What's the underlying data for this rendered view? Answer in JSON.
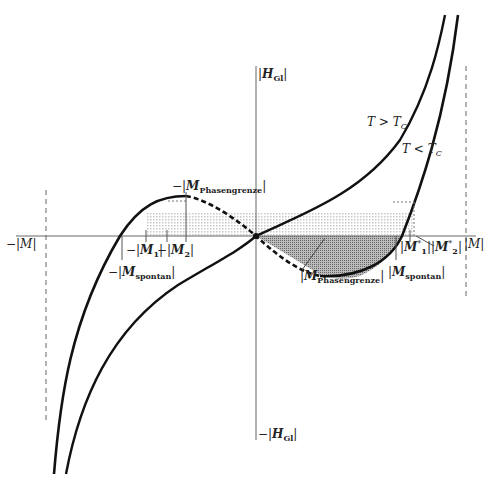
{
  "diagram": {
    "type": "magnetization-field isotherms (van der Waals-like loop)",
    "curves": [
      {
        "name": "T > Tc",
        "label": "T > T",
        "sub": "C",
        "style": "solid"
      },
      {
        "name": "T < Tc",
        "label": "T < T",
        "sub": "C",
        "style": "solid with dashed unstable segment"
      }
    ],
    "axes": {
      "y_pos": {
        "prefix": "|",
        "main": "H",
        "sub": "Gl",
        "suffix": "|"
      },
      "y_neg": {
        "prefix": "−|",
        "main": "H",
        "sub": "Gl",
        "suffix": "|"
      },
      "x_pos": {
        "text": "|M|"
      },
      "x_neg": {
        "text": "−|M|"
      }
    },
    "labels": {
      "neg_phasengrenze": {
        "prefix": "−|",
        "main": "M",
        "sub": "Phasengrenze",
        "suffix": "|"
      },
      "neg_m1": {
        "prefix": "−|",
        "main": "M",
        "sub": "1",
        "suffix": "|"
      },
      "neg_m2": {
        "prefix": "−|",
        "main": "M",
        "sub": "2",
        "suffix": "|"
      },
      "neg_spontan": {
        "prefix": "−|",
        "main": "M",
        "sub": "spontan",
        "suffix": "|"
      },
      "pos_phasengrenze": {
        "prefix": "|",
        "main": "M",
        "sub": "Phasengrenze",
        "suffix": "|"
      },
      "pos_m1": {
        "prefix": "|",
        "main": "M",
        "sub": "1",
        "sup": "*",
        "suffix": "|"
      },
      "pos_m2": {
        "prefix": "|",
        "main": "M",
        "sub": "2",
        "sup": "*",
        "suffix": "|"
      },
      "pos_spontan": {
        "prefix": "|",
        "main": "M",
        "sub": "spontan",
        "suffix": "|"
      }
    },
    "colors": {
      "line": "#111111",
      "axis": "#555555",
      "shade_light": "#d8d8d8",
      "shade_dark": "#9a9a9a"
    }
  }
}
